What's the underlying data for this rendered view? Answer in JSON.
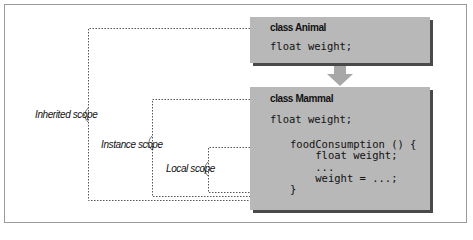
{
  "diagram": {
    "animal_box": {
      "title": "class Animal",
      "code_lines": [
        "float weight;"
      ]
    },
    "mammal_box": {
      "title": "class Mammal",
      "field_line": "float weight;",
      "method_lines": [
        "foodConsumption () {",
        "    float weight;",
        "    ...",
        "    weight = ...;",
        "}"
      ]
    },
    "scopes": {
      "inherited": "Inherited scope",
      "instance": "Instance scope",
      "local": "Local scope"
    },
    "colors": {
      "box_fill": "#b8b8b8",
      "box_shadow": "#4a4a4a",
      "arrow": "#a8a8a8",
      "dashed_line": "#555555"
    }
  }
}
